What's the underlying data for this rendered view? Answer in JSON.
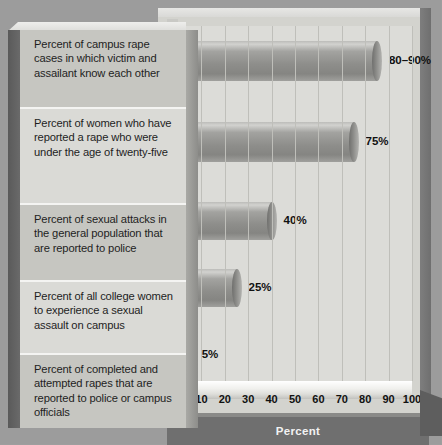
{
  "chart_data": {
    "type": "bar",
    "orientation": "horizontal",
    "title": "",
    "xlabel": "Percent",
    "ylabel": "",
    "xlim": [
      0,
      100
    ],
    "xticks": [
      0,
      10,
      20,
      30,
      40,
      50,
      60,
      70,
      80,
      90,
      100
    ],
    "grid": true,
    "legend": false,
    "categories": [
      "Percent of campus rape cases in which victim and assailant know each other",
      "Percent of women who have reported a rape who were under the age of twenty-five",
      "Percent of sexual attacks in the general population that are reported to police",
      "Percent of all college women to experience a sexual assault on campus",
      "Percent of completed and attempted rapes that are reported to police or campus officials"
    ],
    "values": [
      85,
      75,
      40,
      25,
      5
    ],
    "value_labels": [
      "80–90%",
      "75%",
      "40%",
      "25%",
      "5%"
    ],
    "bar_style": "3d-cylinder",
    "bar_color": "#8e8e8b"
  },
  "colors": {
    "page_background": "#9c9c9c",
    "plot_background": "#dcdcd8",
    "panel_face": "#cdcdc8",
    "row_shade": "#c6c6c1",
    "row_plain": "#dadad6",
    "axis_band": "#6f6f6f",
    "axis_title_text": "#f2f2f2",
    "text": "#1e1e1e"
  },
  "axis": {
    "title": "Percent",
    "ticks": [
      "0",
      "10",
      "20",
      "30",
      "40",
      "50",
      "60",
      "70",
      "80",
      "90",
      "100"
    ]
  },
  "rows": [
    {
      "label": "Percent of campus rape cases in which victim and assailant know each other",
      "value_label": "80–90%"
    },
    {
      "label": "Percent of women who have reported a rape who were under the age of twenty-five",
      "value_label": "75%"
    },
    {
      "label": "Percent of sexual attacks in the general population that are reported to police",
      "value_label": "40%"
    },
    {
      "label": "Percent of all college women to experience a sexual assault on campus",
      "value_label": "25%"
    },
    {
      "label": "Percent of completed and attempted rapes that are reported to police or campus officials",
      "value_label": "5%"
    }
  ]
}
